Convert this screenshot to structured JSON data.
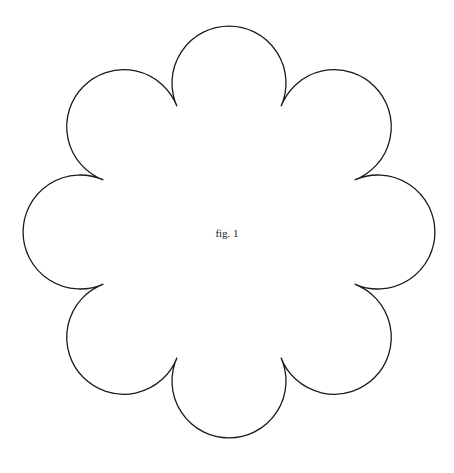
{
  "figure": {
    "caption": "fig. 1",
    "shape": "scalloped-circle",
    "petals": 8,
    "center": [
      229,
      232
    ],
    "notch_radius": 136,
    "petal_arc_radius": 57,
    "stroke_color": "#1a1a1a",
    "fill_color": "#ffffff",
    "background": "#ffffff"
  }
}
